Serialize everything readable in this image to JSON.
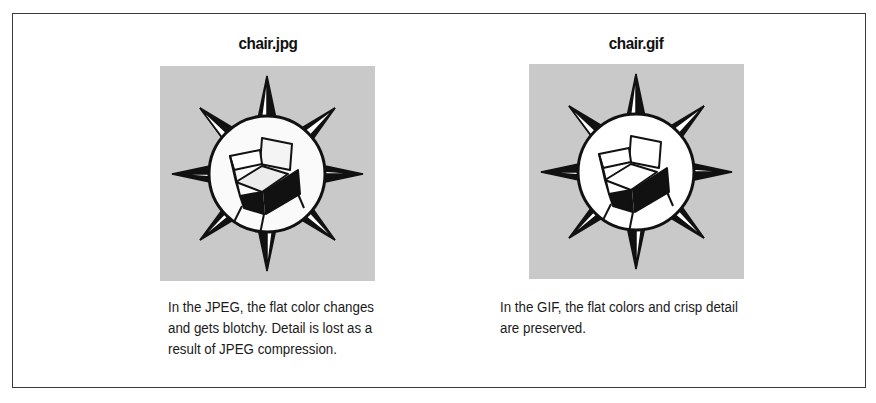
{
  "figure": {
    "panels": [
      {
        "id": "jpeg",
        "title": "chair.jpg",
        "image_icon": "compass-star-chair-icon",
        "image_quality": "blotchy (JPEG compression)",
        "description_lines": [
          "In the JPEG, the flat color changes",
          "and gets blotchy. Detail is lost as a",
          "result of JPEG compression."
        ]
      },
      {
        "id": "gif",
        "title": "chair.gif",
        "image_icon": "compass-star-chair-icon",
        "image_quality": "crisp (GIF)",
        "description_lines": [
          "In the GIF, the flat colors and crisp detail",
          "are preserved."
        ]
      }
    ],
    "colors": {
      "image_background": "#c9c9c9",
      "border": "#3a3a3a",
      "ink": "#111111"
    }
  }
}
